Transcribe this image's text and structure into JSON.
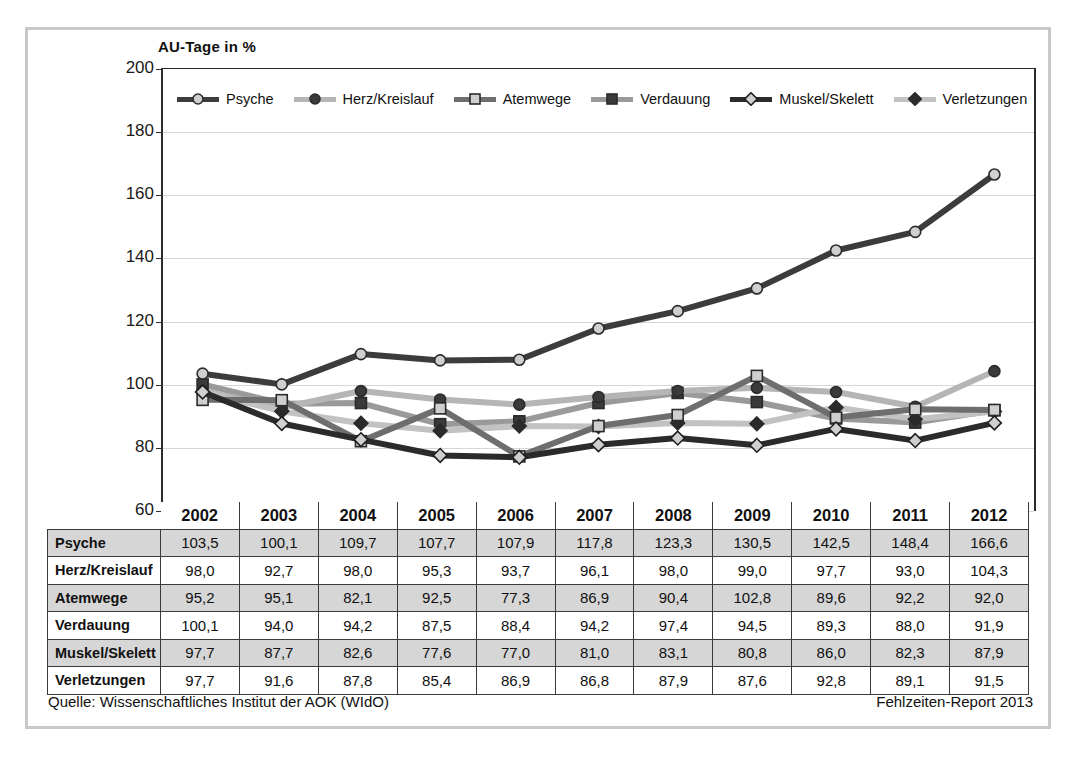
{
  "axis_title": "AU-Tage in %",
  "footer": {
    "source": "Quelle: Wissenschaftliches Institut der AOK (WIdO)",
    "report": "Fehlzeiten-Report 2013"
  },
  "legend_position": "top-inside",
  "chart_data": {
    "type": "line",
    "title": "AU-Tage in %",
    "xlabel": "",
    "ylabel": "AU-Tage in %",
    "ylim": [
      60,
      200
    ],
    "ytick_step": 20,
    "yticks": [
      60,
      80,
      100,
      120,
      140,
      160,
      180,
      200
    ],
    "grid": true,
    "categories": [
      "2002",
      "2003",
      "2004",
      "2005",
      "2006",
      "2007",
      "2008",
      "2009",
      "2010",
      "2011",
      "2012"
    ],
    "series": [
      {
        "name": "Psyche",
        "values": [
          103.5,
          100.1,
          109.7,
          107.7,
          107.9,
          117.8,
          123.3,
          130.5,
          142.5,
          148.4,
          166.6
        ],
        "line_color": "#3c3c3c",
        "marker": "circle",
        "marker_fill": "#cfcfcf",
        "marker_stroke": "#2b2b2b"
      },
      {
        "name": "Herz/Kreislauf",
        "values": [
          98.0,
          92.7,
          98.0,
          95.3,
          93.7,
          96.1,
          98.0,
          99.0,
          97.7,
          93.0,
          104.3
        ],
        "line_color": "#b5b5b5",
        "marker": "circle",
        "marker_fill": "#3a3a3a",
        "marker_stroke": "#2b2b2b"
      },
      {
        "name": "Atemwege",
        "values": [
          95.2,
          95.1,
          82.1,
          92.5,
          77.3,
          86.9,
          90.4,
          102.8,
          89.6,
          92.2,
          92.0
        ],
        "line_color": "#6e6e6e",
        "marker": "square",
        "marker_fill": "#cfcfcf",
        "marker_stroke": "#2b2b2b"
      },
      {
        "name": "Verdauung",
        "values": [
          100.1,
          94.0,
          94.2,
          87.5,
          88.4,
          94.2,
          97.4,
          94.5,
          89.3,
          88.0,
          91.9
        ],
        "line_color": "#9a9a9a",
        "marker": "square",
        "marker_fill": "#3a3a3a",
        "marker_stroke": "#2b2b2b"
      },
      {
        "name": "Muskel/Skelett",
        "values": [
          97.7,
          87.7,
          82.6,
          77.6,
          77.0,
          81.0,
          83.1,
          80.8,
          86.0,
          82.3,
          87.9
        ],
        "line_color": "#2b2b2b",
        "marker": "diamond",
        "marker_fill": "#cfcfcf",
        "marker_stroke": "#1f1f1f"
      },
      {
        "name": "Verletzungen",
        "values": [
          97.7,
          91.6,
          87.8,
          85.4,
          86.9,
          86.8,
          87.9,
          87.6,
          92.8,
          89.1,
          91.5
        ],
        "line_color": "#c2c2c2",
        "marker": "diamond",
        "marker_fill": "#2b2b2b",
        "marker_stroke": "#2b2b2b"
      }
    ]
  },
  "table": {
    "corner_label": "",
    "year_headers": [
      "2002",
      "2003",
      "2004",
      "2005",
      "2006",
      "2007",
      "2008",
      "2009",
      "2010",
      "2011",
      "2012"
    ],
    "rows": [
      {
        "label": "Psyche",
        "shaded": true,
        "values": [
          "103,5",
          "100,1",
          "109,7",
          "107,7",
          "107,9",
          "117,8",
          "123,3",
          "130,5",
          "142,5",
          "148,4",
          "166,6"
        ]
      },
      {
        "label": "Herz/Kreislauf",
        "shaded": false,
        "values": [
          "98,0",
          "92,7",
          "98,0",
          "95,3",
          "93,7",
          "96,1",
          "98,0",
          "99,0",
          "97,7",
          "93,0",
          "104,3"
        ]
      },
      {
        "label": "Atemwege",
        "shaded": true,
        "values": [
          "95,2",
          "95,1",
          "82,1",
          "92,5",
          "77,3",
          "86,9",
          "90,4",
          "102,8",
          "89,6",
          "92,2",
          "92,0"
        ]
      },
      {
        "label": "Verdauung",
        "shaded": false,
        "values": [
          "100,1",
          "94,0",
          "94,2",
          "87,5",
          "88,4",
          "94,2",
          "97,4",
          "94,5",
          "89,3",
          "88,0",
          "91,9"
        ]
      },
      {
        "label": "Muskel/Skelett",
        "shaded": true,
        "values": [
          "97,7",
          "87,7",
          "82,6",
          "77,6",
          "77,0",
          "81,0",
          "83,1",
          "80,8",
          "86,0",
          "82,3",
          "87,9"
        ]
      },
      {
        "label": "Verletzungen",
        "shaded": false,
        "values": [
          "97,7",
          "91,6",
          "87,8",
          "85,4",
          "86,9",
          "86,8",
          "87,9",
          "87,6",
          "92,8",
          "89,1",
          "91,5"
        ]
      }
    ]
  }
}
